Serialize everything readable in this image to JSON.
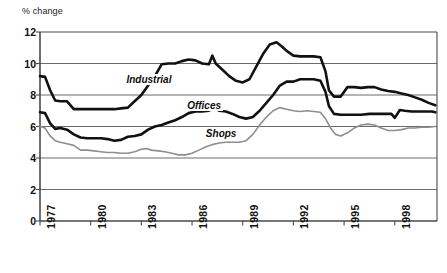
{
  "chart_data": {
    "type": "line",
    "title": "",
    "subtitle": "",
    "xlabel": "",
    "ylabel": "% change",
    "ylim": [
      0,
      12
    ],
    "xlim": [
      1977,
      2000.5
    ],
    "yticks": [
      0,
      2,
      4,
      6,
      8,
      10,
      12
    ],
    "xticks": [
      1977,
      1980,
      1983,
      1986,
      1989,
      1992,
      1995,
      1998
    ],
    "grid": "horizontal",
    "legend_position": "inline-annotations",
    "annotations": [
      {
        "text": "Industrial",
        "x": 1982.0,
        "y": 8.95
      },
      {
        "text": "Offices",
        "x": 1985.6,
        "y": 7.3
      },
      {
        "text": "Shops",
        "x": 1986.7,
        "y": 5.55
      }
    ],
    "series": [
      {
        "name": "Industrial",
        "color": "#111111",
        "width": 2.6,
        "x": [
          1977.0,
          1977.3,
          1977.6,
          1977.9,
          1978.2,
          1978.6,
          1979.0,
          1979.4,
          1979.8,
          1980.2,
          1980.6,
          1981.0,
          1981.4,
          1981.8,
          1982.2,
          1982.6,
          1983.0,
          1983.4,
          1983.8,
          1984.2,
          1984.6,
          1985.0,
          1985.4,
          1985.8,
          1986.2,
          1986.6,
          1987.0,
          1987.2,
          1987.4,
          1987.8,
          1988.2,
          1988.6,
          1989.0,
          1989.4,
          1989.8,
          1990.2,
          1990.6,
          1991.0,
          1991.3,
          1991.6,
          1992.0,
          1992.4,
          1992.8,
          1993.2,
          1993.6,
          1993.9,
          1994.1,
          1994.4,
          1994.8,
          1995.2,
          1995.6,
          1996.0,
          1996.4,
          1996.8,
          1997.2,
          1997.6,
          1998.0,
          1998.4,
          1998.8,
          1999.2,
          1999.6,
          2000.0,
          2000.4
        ],
        "y": [
          9.2,
          9.15,
          8.3,
          7.65,
          7.6,
          7.6,
          7.1,
          7.1,
          7.1,
          7.1,
          7.1,
          7.1,
          7.1,
          7.15,
          7.2,
          7.6,
          8.0,
          8.6,
          9.2,
          9.95,
          10.0,
          10.0,
          10.15,
          10.25,
          10.2,
          10.0,
          9.95,
          10.5,
          10.0,
          9.6,
          9.2,
          8.9,
          8.8,
          9.0,
          9.8,
          10.6,
          11.2,
          11.35,
          11.1,
          10.8,
          10.5,
          10.45,
          10.45,
          10.45,
          10.4,
          9.5,
          8.3,
          7.9,
          7.9,
          8.5,
          8.5,
          8.45,
          8.5,
          8.5,
          8.35,
          8.25,
          8.2,
          8.1,
          8.0,
          7.85,
          7.7,
          7.5,
          7.35
        ]
      },
      {
        "name": "Offices",
        "color": "#111111",
        "width": 2.6,
        "x": [
          1977.0,
          1977.3,
          1977.6,
          1977.9,
          1978.2,
          1978.6,
          1979.0,
          1979.4,
          1979.8,
          1980.2,
          1980.6,
          1981.0,
          1981.4,
          1981.8,
          1982.2,
          1982.6,
          1983.0,
          1983.4,
          1983.8,
          1984.2,
          1984.6,
          1985.0,
          1985.4,
          1985.8,
          1986.2,
          1986.6,
          1987.0,
          1987.3,
          1987.6,
          1988.0,
          1988.4,
          1988.8,
          1989.2,
          1989.6,
          1990.0,
          1990.4,
          1990.8,
          1991.2,
          1991.6,
          1992.0,
          1992.4,
          1992.8,
          1993.2,
          1993.6,
          1993.9,
          1994.1,
          1994.4,
          1994.8,
          1995.2,
          1995.6,
          1996.0,
          1996.5,
          1997.0,
          1997.4,
          1997.8,
          1998.0,
          1998.3,
          1998.6,
          1999.0,
          1999.4,
          1999.8,
          2000.2,
          2000.4
        ],
        "y": [
          6.9,
          6.85,
          6.2,
          5.85,
          5.9,
          5.8,
          5.5,
          5.3,
          5.25,
          5.25,
          5.25,
          5.2,
          5.1,
          5.15,
          5.35,
          5.4,
          5.5,
          5.8,
          6.0,
          6.1,
          6.25,
          6.4,
          6.6,
          6.85,
          6.95,
          6.95,
          7.0,
          7.2,
          7.0,
          6.95,
          6.8,
          6.6,
          6.5,
          6.6,
          7.0,
          7.5,
          8.0,
          8.6,
          8.85,
          8.85,
          9.0,
          9.0,
          9.0,
          8.9,
          8.2,
          7.3,
          6.8,
          6.75,
          6.75,
          6.75,
          6.75,
          6.8,
          6.8,
          6.8,
          6.8,
          6.55,
          7.05,
          7.0,
          6.95,
          6.95,
          6.95,
          6.95,
          6.9
        ]
      },
      {
        "name": "Shops",
        "color": "#8e8e8e",
        "width": 1.6,
        "x": [
          1977.0,
          1977.3,
          1977.6,
          1977.9,
          1978.2,
          1978.6,
          1979.0,
          1979.4,
          1979.8,
          1980.2,
          1980.6,
          1981.0,
          1981.4,
          1981.8,
          1982.2,
          1982.6,
          1983.0,
          1983.3,
          1983.6,
          1984.0,
          1984.4,
          1984.8,
          1985.2,
          1985.6,
          1986.0,
          1986.4,
          1986.8,
          1987.2,
          1987.6,
          1988.0,
          1988.4,
          1988.8,
          1989.2,
          1989.6,
          1990.0,
          1990.4,
          1990.8,
          1991.2,
          1991.6,
          1992.0,
          1992.4,
          1992.8,
          1993.2,
          1993.6,
          1993.9,
          1994.2,
          1994.5,
          1994.8,
          1995.2,
          1995.6,
          1996.0,
          1996.4,
          1996.8,
          1997.2,
          1997.6,
          1998.0,
          1998.4,
          1998.8,
          1999.2,
          1999.6,
          2000.0,
          2000.4
        ],
        "y": [
          6.0,
          5.9,
          5.4,
          5.1,
          5.0,
          4.9,
          4.8,
          4.5,
          4.5,
          4.45,
          4.4,
          4.35,
          4.35,
          4.3,
          4.3,
          4.4,
          4.55,
          4.6,
          4.5,
          4.45,
          4.4,
          4.3,
          4.2,
          4.2,
          4.3,
          4.5,
          4.7,
          4.85,
          4.95,
          5.0,
          5.0,
          5.0,
          5.1,
          5.5,
          6.1,
          6.6,
          7.0,
          7.2,
          7.1,
          7.0,
          6.95,
          7.0,
          6.95,
          6.9,
          6.5,
          5.9,
          5.5,
          5.4,
          5.6,
          5.9,
          6.1,
          6.15,
          6.1,
          5.9,
          5.75,
          5.75,
          5.8,
          5.9,
          5.9,
          5.95,
          5.95,
          6.0
        ]
      }
    ]
  },
  "axes": {
    "ylabel_text": "% change",
    "ytick_labels": [
      "12",
      "10",
      "8",
      "6",
      "4",
      "2",
      "0"
    ],
    "xtick_labels": [
      "1977",
      "1980",
      "1983",
      "1986",
      "1989",
      "1992",
      "1995",
      "1998"
    ]
  },
  "colors": {
    "industrial": "#111111",
    "offices": "#111111",
    "shops": "#8e8e8e",
    "grid": "#5a5a5a",
    "frame": "#4a4a4a",
    "background": "#ffffff"
  }
}
